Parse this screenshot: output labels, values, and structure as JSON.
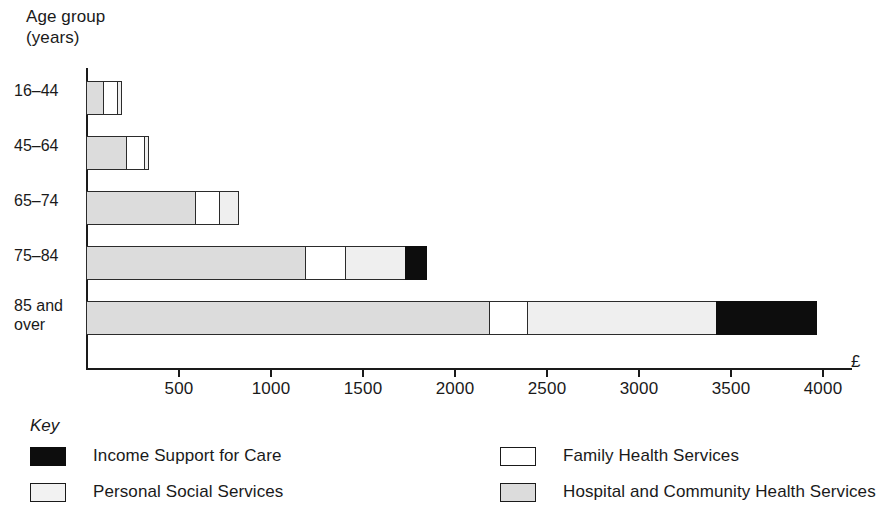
{
  "axis_title": "Age group\n(years)",
  "currency_symbol": "£",
  "key_title": "Key",
  "legend": [
    {
      "label": "Income Support for Care",
      "key": "isc",
      "color": "#0d0d0d"
    },
    {
      "label": "Personal Social Services",
      "key": "pss",
      "color": "#efefef"
    },
    {
      "label": "Family Health Services",
      "key": "fam",
      "color": "#ffffff"
    },
    {
      "label": "Hospital and Community Health Services",
      "key": "hosp",
      "color": "#dcdcdc"
    }
  ],
  "categories": [
    "16–44",
    "45–64",
    "65–74",
    "75–84",
    "85 and\nover"
  ],
  "tick_labels": [
    "500",
    "1000",
    "1500",
    "2000",
    "2500",
    "3000",
    "3500",
    "4000"
  ],
  "chart_data": {
    "type": "bar",
    "orientation": "horizontal",
    "stacked": true,
    "title": "",
    "xlabel": "£",
    "ylabel": "Age group (years)",
    "categories": [
      "16–44",
      "45–64",
      "65–74",
      "75–84",
      "85 and over"
    ],
    "xlim": [
      0,
      4350
    ],
    "xticks": [
      500,
      1000,
      1500,
      2000,
      2500,
      3000,
      3500,
      4000
    ],
    "grid": false,
    "legend_position": "bottom",
    "series": [
      {
        "name": "Hospital and Community Health Services",
        "color": "#dcdcdc",
        "values": [
          100,
          225,
          600,
          1200,
          2200
        ]
      },
      {
        "name": "Family Health Services",
        "color": "#ffffff",
        "values": [
          85,
          105,
          140,
          225,
          215
        ]
      },
      {
        "name": "Personal Social Services",
        "color": "#efefef",
        "values": [
          30,
          30,
          110,
          335,
          1035
        ]
      },
      {
        "name": "Income Support for Care",
        "color": "#0d0d0d",
        "values": [
          0,
          0,
          0,
          120,
          550
        ]
      }
    ],
    "totals": [
      215,
      360,
      850,
      1880,
      4000
    ]
  }
}
